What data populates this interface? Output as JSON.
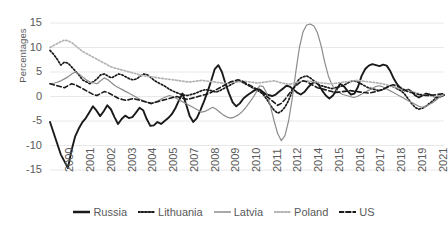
{
  "axis": {
    "ylabel": "Percentages",
    "yticks": [
      "15",
      "10",
      "5",
      "0",
      "-5",
      "-10",
      "-15"
    ],
    "xticks": [
      "2000",
      "2001",
      "2002",
      "2003",
      "2004",
      "2005",
      "2007",
      "2008",
      "2009",
      "2010",
      "2011",
      "2012",
      "2014",
      "2015",
      "2016",
      "2017",
      "2018",
      "2019",
      "2021"
    ]
  },
  "legend": {
    "items": [
      {
        "label": "Russia",
        "style": "solid-thick",
        "color": "#1a1a1a"
      },
      {
        "label": "Lithuania",
        "style": "dotted",
        "color": "#1a1a1a"
      },
      {
        "label": "Latvia",
        "style": "solid-thin",
        "color": "#8c8c8c"
      },
      {
        "label": "Poland",
        "style": "dotted",
        "color": "#b3b3b3"
      },
      {
        "label": "US",
        "style": "dashed",
        "color": "#1a1a1a"
      }
    ]
  },
  "chart_data": {
    "type": "line",
    "title": "",
    "xlabel": "",
    "ylabel": "Percentages",
    "ylim": [
      -15,
      15
    ],
    "xlim": [
      2000,
      2021.5
    ],
    "grid": true,
    "legend_position": "bottom",
    "x_tick_labels": [
      "2000",
      "2001",
      "2002",
      "2003",
      "2004",
      "2005",
      "2007",
      "2008",
      "2009",
      "2010",
      "2011",
      "2012",
      "2014",
      "2015",
      "2016",
      "2017",
      "2018",
      "2019",
      "2021"
    ],
    "x_start": 2000,
    "x_step": 0.25,
    "series": [
      {
        "name": "Russia",
        "color": "#1a1a1a",
        "style": "solid-thick",
        "values": [
          -5.2,
          -7.4,
          -9.6,
          -11.8,
          -13.2,
          -14.6,
          -11.0,
          -8.2,
          -6.6,
          -5.3,
          -4.4,
          -3.2,
          -2.0,
          -2.9,
          -4.0,
          -3.0,
          -1.8,
          -2.6,
          -4.2,
          -5.6,
          -4.6,
          -3.9,
          -4.4,
          -4.2,
          -3.3,
          -2.3,
          -2.8,
          -4.6,
          -6.0,
          -5.9,
          -5.2,
          -5.6,
          -5.0,
          -4.4,
          -3.6,
          -2.4,
          -0.8,
          0.6,
          -1.6,
          -4.0,
          -5.2,
          -4.4,
          -2.8,
          -1.0,
          1.0,
          3.2,
          5.6,
          6.4,
          5.0,
          2.6,
          0.6,
          -1.2,
          -2.0,
          -1.4,
          -0.4,
          0.2,
          0.7,
          1.2,
          1.6,
          1.2,
          0.6,
          0.3,
          0.1,
          0.4,
          1.0,
          1.6,
          2.2,
          2.0,
          1.4,
          0.8,
          0.4,
          0.9,
          1.8,
          2.6,
          3.0,
          2.4,
          1.2,
          0.2,
          -0.4,
          0.2,
          1.4,
          2.6,
          2.1,
          1.2,
          0.4,
          0.6,
          2.0,
          4.2,
          5.6,
          6.3,
          6.6,
          6.4,
          6.2,
          6.5,
          6.3,
          5.2,
          3.6,
          2.4,
          1.6,
          1.2,
          1.4,
          1.0,
          0.2,
          -0.2,
          0.2,
          0.6,
          0.4,
          0.1,
          -0.2,
          0.0,
          0.3
        ]
      },
      {
        "name": "Lithuania",
        "color": "#1a1a1a",
        "style": "dotted",
        "values": [
          9.4,
          8.6,
          7.6,
          6.4,
          7.0,
          6.8,
          6.0,
          5.2,
          4.4,
          3.4,
          3.0,
          2.6,
          3.0,
          3.6,
          4.4,
          4.6,
          4.2,
          3.8,
          4.2,
          4.6,
          4.4,
          4.0,
          3.6,
          3.4,
          3.6,
          4.2,
          4.6,
          4.4,
          3.8,
          3.2,
          2.8,
          2.4,
          2.0,
          1.5,
          1.1,
          0.8,
          0.5,
          0.3,
          0.2,
          0.4,
          0.6,
          0.9,
          1.2,
          1.4,
          1.3,
          1.1,
          0.9,
          1.2,
          1.6,
          2.0,
          2.4,
          2.8,
          3.2,
          3.0,
          2.6,
          2.2,
          1.8,
          1.4,
          1.0,
          0.4,
          -0.6,
          -1.8,
          -2.8,
          -3.4,
          -3.0,
          -2.2,
          -0.8,
          1.0,
          2.6,
          3.6,
          4.0,
          4.2,
          3.8,
          3.2,
          2.6,
          2.2,
          2.0,
          1.8,
          1.6,
          1.8,
          2.0,
          2.2,
          2.6,
          3.0,
          3.2,
          3.0,
          2.6,
          2.2,
          1.8,
          1.6,
          1.4,
          1.2,
          1.4,
          1.8,
          2.2,
          2.0,
          1.6,
          1.2,
          0.6,
          -0.4,
          -1.4,
          -2.2,
          -2.6,
          -2.4,
          -2.0,
          -1.4,
          -0.8,
          -0.2,
          0.2,
          0.4
        ]
      },
      {
        "name": "Latvia",
        "color": "#8c8c8c",
        "style": "solid-thin",
        "values": [
          2.6,
          2.7,
          2.9,
          3.2,
          3.6,
          4.0,
          4.6,
          5.0,
          4.6,
          4.0,
          3.4,
          3.0,
          2.8,
          2.6,
          3.2,
          3.8,
          3.4,
          2.8,
          2.2,
          1.8,
          1.4,
          1.0,
          0.6,
          0.2,
          -0.2,
          -0.6,
          -0.9,
          -1.2,
          -1.5,
          -1.2,
          -0.8,
          -0.4,
          -0.1,
          0.2,
          0.0,
          -0.4,
          -0.8,
          -1.2,
          -1.6,
          -2.0,
          -2.4,
          -2.8,
          -3.2,
          -3.0,
          -2.6,
          -2.2,
          -2.6,
          -3.2,
          -3.8,
          -4.2,
          -4.4,
          -4.2,
          -3.8,
          -3.2,
          -2.4,
          -1.4,
          -0.4,
          0.8,
          2.2,
          2.0,
          0.6,
          -2.0,
          -5.0,
          -7.6,
          -9.0,
          -8.0,
          -5.0,
          -0.5,
          5.0,
          10.0,
          13.2,
          14.6,
          14.8,
          14.4,
          13.0,
          10.4,
          7.0,
          4.2,
          2.4,
          1.4,
          0.8,
          0.4,
          0.2,
          0.0,
          -0.2,
          0.0,
          0.4,
          0.8,
          1.2,
          1.6,
          2.0,
          2.2,
          2.0,
          1.6,
          1.2,
          0.8,
          0.4,
          0.0,
          -0.4,
          -0.8,
          -1.2,
          -1.6,
          -2.0,
          -2.2,
          -2.0,
          -1.6,
          -1.2,
          -0.6,
          0.0,
          0.4
        ]
      },
      {
        "name": "Poland",
        "color": "#b3b3b3",
        "style": "dotted",
        "values": [
          10.0,
          10.4,
          10.8,
          11.2,
          11.5,
          11.4,
          11.0,
          10.4,
          9.8,
          9.2,
          8.8,
          8.4,
          8.0,
          7.6,
          7.2,
          6.8,
          6.4,
          6.0,
          5.8,
          5.6,
          5.4,
          5.2,
          5.0,
          4.8,
          4.6,
          4.4,
          4.2,
          4.1,
          4.0,
          3.9,
          3.8,
          3.7,
          3.6,
          3.5,
          3.4,
          3.3,
          3.2,
          3.1,
          3.0,
          3.0,
          3.1,
          3.2,
          3.3,
          3.2,
          3.1,
          3.0,
          2.9,
          2.8,
          2.7,
          2.7,
          2.8,
          2.9,
          3.0,
          3.1,
          3.1,
          3.0,
          2.9,
          2.8,
          2.8,
          2.9,
          3.0,
          3.1,
          3.2,
          3.0,
          2.8,
          2.6,
          2.5,
          2.6,
          2.8,
          3.0,
          3.1,
          3.2,
          3.1,
          3.0,
          2.9,
          2.8,
          2.7,
          2.6,
          2.6,
          2.7,
          2.8,
          2.9,
          3.0,
          3.1,
          3.2,
          3.3,
          3.2,
          3.1,
          3.0,
          2.9,
          2.8,
          2.7,
          2.6,
          2.4,
          2.2,
          2.0,
          1.8,
          1.6,
          1.4,
          1.2,
          1.0,
          0.8,
          0.6,
          0.4,
          0.2,
          0.1,
          0.0,
          0.1,
          0.2,
          0.3
        ]
      },
      {
        "name": "US",
        "color": "#1a1a1a",
        "style": "dashed",
        "values": [
          2.6,
          2.4,
          2.2,
          2.0,
          1.8,
          2.2,
          2.6,
          2.4,
          2.0,
          1.6,
          1.2,
          0.8,
          0.4,
          0.2,
          0.6,
          1.0,
          0.8,
          0.4,
          0.0,
          -0.4,
          -0.6,
          -0.8,
          -0.6,
          -0.4,
          -0.6,
          -0.8,
          -1.0,
          -1.2,
          -1.4,
          -1.2,
          -1.0,
          -0.8,
          -0.6,
          -0.4,
          -0.2,
          0.0,
          -0.2,
          -0.4,
          -0.6,
          -0.4,
          -0.2,
          0.0,
          0.2,
          0.4,
          0.6,
          1.0,
          1.4,
          1.8,
          2.2,
          2.6,
          3.0,
          3.2,
          3.4,
          3.2,
          2.8,
          2.4,
          2.0,
          1.6,
          1.2,
          0.6,
          0.0,
          -0.6,
          -1.2,
          -1.8,
          -1.4,
          -0.6,
          0.4,
          1.4,
          2.2,
          2.8,
          3.2,
          3.0,
          2.6,
          2.2,
          1.8,
          1.6,
          1.4,
          1.2,
          1.0,
          0.8,
          0.9,
          1.0,
          1.1,
          1.2,
          1.1,
          1.0,
          0.9,
          0.8,
          0.7,
          0.8,
          1.0,
          1.2,
          1.4,
          1.8,
          2.2,
          2.4,
          2.2,
          1.8,
          1.4,
          1.0,
          0.8,
          0.6,
          0.4,
          0.3,
          0.2,
          0.2,
          0.3,
          0.4,
          0.5,
          0.6
        ]
      }
    ]
  }
}
